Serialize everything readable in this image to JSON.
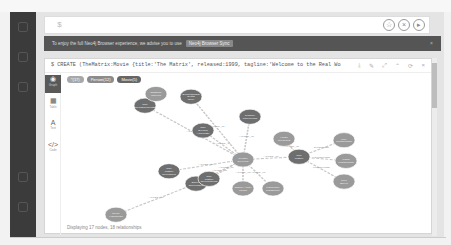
{
  "editor": {
    "prompt": "$",
    "actions": [
      {
        "name": "favorite",
        "icon": "star-icon",
        "glyph": "☆"
      },
      {
        "name": "clear",
        "icon": "close-circle-icon",
        "glyph": "×"
      },
      {
        "name": "run",
        "icon": "play-icon",
        "glyph": "▸"
      }
    ]
  },
  "banner": {
    "text": "To enjoy the full Neo4j Browser experience, we advise you to use",
    "button": "Neo4j Browser Sync",
    "close": "×"
  },
  "frame": {
    "query": "$ CREATE (TheMatrix:Movie {title:'The Matrix', released:1999, tagline:'Welcome to the Real World'}) CREATE (Keanu:Per…",
    "tools": [
      "⤓",
      "✎",
      "⤢",
      "⌃",
      "⟳",
      "×"
    ],
    "side": [
      {
        "label": "Graph",
        "glyph": "◉",
        "active": true
      },
      {
        "label": "Table",
        "glyph": "▦",
        "active": false
      },
      {
        "label": "Text",
        "glyph": "A",
        "active": false
      },
      {
        "label": "Code",
        "glyph": "</>",
        "active": false
      }
    ],
    "pills": [
      {
        "label": "*(17)",
        "kind": "all"
      },
      {
        "label": "Person(12)",
        "kind": "person"
      },
      {
        "label": "Movie(5)",
        "kind": "movie"
      }
    ],
    "status": "Displaying 17 nodes, 18 relationships"
  },
  "graph": {
    "colors": {
      "person": "#9a9a9a",
      "movie": "#6e6e6e",
      "edge": "#c8c8c8"
    },
    "nodes": [
      {
        "id": "keanu",
        "label": "Keanu Reeves",
        "kind": "person",
        "x": 182,
        "y": 108
      },
      {
        "id": "matrix",
        "label": "The Matrix",
        "kind": "movie",
        "x": 238,
        "y": 104
      },
      {
        "id": "devil",
        "label": "The Devil's Advocate",
        "kind": "movie",
        "x": 142,
        "y": 66
      },
      {
        "id": "mnemonic",
        "label": "Johnny Mnemonic",
        "kind": "movie",
        "x": 189,
        "y": 46
      },
      {
        "id": "something",
        "label": "Something's Gotta Give",
        "kind": "movie",
        "x": 130,
        "y": 17
      },
      {
        "id": "replacements",
        "label": "The Replacements",
        "kind": "movie",
        "x": 84,
        "y": 30
      },
      {
        "id": "charlize",
        "label": "Charlize Theron",
        "kind": "person",
        "x": 95,
        "y": 13
      },
      {
        "id": "sweet",
        "label": "Sweet November",
        "kind": "movie",
        "x": 135,
        "y": 143
      },
      {
        "id": "gene",
        "label": "Gene Hackman",
        "kind": "person",
        "x": 55,
        "y": 188
      },
      {
        "id": "reloaded",
        "label": "The Matrix Reloaded",
        "kind": "movie",
        "x": 108,
        "y": 125
      },
      {
        "id": "revolutions",
        "label": "The Matrix Revolutions",
        "kind": "movie",
        "x": 148,
        "y": 136
      },
      {
        "id": "hugo",
        "label": "Hugo Weaving",
        "kind": "person",
        "x": 223,
        "y": 78
      },
      {
        "id": "lilly",
        "label": "Lilly Wachowski",
        "kind": "person",
        "x": 283,
        "y": 80
      },
      {
        "id": "lana",
        "label": "Lana Wachowski",
        "kind": "person",
        "x": 285,
        "y": 110
      },
      {
        "id": "joel",
        "label": "Joel Silver",
        "kind": "person",
        "x": 283,
        "y": 140
      },
      {
        "id": "carrie",
        "label": "Carrie-Anne Moss",
        "kind": "person",
        "x": 182,
        "y": 150
      },
      {
        "id": "laurence",
        "label": "Laurence Fishburne",
        "kind": "person",
        "x": 212,
        "y": 150
      }
    ],
    "edges": [
      {
        "from": "keanu",
        "to": "matrix",
        "label": "ACTED_IN"
      },
      {
        "from": "keanu",
        "to": "devil",
        "label": "ACTED_IN"
      },
      {
        "from": "keanu",
        "to": "mnemonic",
        "label": "ACTED_IN"
      },
      {
        "from": "keanu",
        "to": "something",
        "label": "ACTED_IN"
      },
      {
        "from": "keanu",
        "to": "replacements",
        "label": "ACTED_IN"
      },
      {
        "from": "charlize",
        "to": "replacements",
        "label": "ACTED_IN"
      },
      {
        "from": "keanu",
        "to": "sweet",
        "label": "ACTED_IN"
      },
      {
        "from": "gene",
        "to": "sweet",
        "label": "ACTED_IN"
      },
      {
        "from": "keanu",
        "to": "reloaded",
        "label": "ACTED_IN"
      },
      {
        "from": "keanu",
        "to": "revolutions",
        "label": "ACTED_IN"
      },
      {
        "from": "keanu",
        "to": "carrie",
        "label": "ACTED_IN"
      },
      {
        "from": "keanu",
        "to": "laurence",
        "label": "ACTED_IN"
      },
      {
        "from": "hugo",
        "to": "matrix",
        "label": "ACTED_IN"
      },
      {
        "from": "lilly",
        "to": "matrix",
        "label": "DIRECTED"
      },
      {
        "from": "lana",
        "to": "matrix",
        "label": "DIRECTED"
      },
      {
        "from": "joel",
        "to": "matrix",
        "label": "PRODUCED"
      }
    ]
  }
}
